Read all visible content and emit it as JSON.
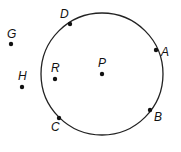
{
  "diagram": {
    "circle": {
      "center": "P",
      "cx": 102,
      "cy": 74,
      "r": 61,
      "stroke": "#222222"
    },
    "points": [
      {
        "id": "D",
        "label": "D",
        "x": 70,
        "y": 24,
        "lx": 60,
        "ly": 18,
        "on_circle": true
      },
      {
        "id": "A",
        "label": "A",
        "x": 156,
        "y": 50,
        "lx": 161,
        "ly": 56,
        "on_circle": true
      },
      {
        "id": "B",
        "label": "B",
        "x": 150,
        "y": 110,
        "lx": 154,
        "ly": 121,
        "on_circle": true
      },
      {
        "id": "C",
        "label": "C",
        "x": 59,
        "y": 118,
        "lx": 51,
        "ly": 131,
        "on_circle": true
      },
      {
        "id": "P",
        "label": "P",
        "x": 102,
        "y": 74,
        "lx": 98,
        "ly": 67,
        "on_circle": false
      },
      {
        "id": "R",
        "label": "R",
        "x": 55,
        "y": 79,
        "lx": 51,
        "ly": 72,
        "on_circle": false
      },
      {
        "id": "G",
        "label": "G",
        "x": 11,
        "y": 44,
        "lx": 7,
        "ly": 38,
        "on_circle": false
      },
      {
        "id": "H",
        "label": "H",
        "x": 22,
        "y": 87,
        "lx": 18,
        "ly": 80,
        "on_circle": false
      }
    ]
  }
}
